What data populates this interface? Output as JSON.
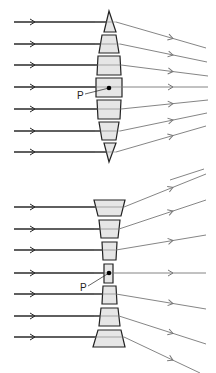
{
  "colors": {
    "background": "#ffffff",
    "incoming_ray": "#2a2a2a",
    "outgoing_ray": "#777777",
    "prism_fill": "#e6e6e6",
    "prism_stroke": "#222222",
    "point": "#000000"
  },
  "diagrams": [
    {
      "name": "converging-lens",
      "point_label": "P",
      "center_x": 109,
      "label_pos": {
        "x": 77,
        "y": 91
      },
      "point": {
        "x": 109,
        "y": 88
      },
      "rays": [
        {
          "y": 22,
          "exit_x": 116,
          "end": {
            "x": 206,
            "y": 48
          }
        },
        {
          "y": 44,
          "exit_x": 120,
          "end": {
            "x": 207,
            "y": 62
          }
        },
        {
          "y": 65,
          "exit_x": 121,
          "end": {
            "x": 208,
            "y": 76
          }
        },
        {
          "y": 87,
          "exit_x": 121,
          "end": {
            "x": 208,
            "y": 87
          }
        },
        {
          "y": 109,
          "exit_x": 121,
          "end": {
            "x": 208,
            "y": 100
          }
        },
        {
          "y": 131,
          "exit_x": 120,
          "end": {
            "x": 207,
            "y": 113
          }
        },
        {
          "y": 152,
          "exit_x": 116,
          "end": {
            "x": 206,
            "y": 126
          }
        }
      ],
      "prisms": [
        {
          "points": "109,11 104,32 116,32"
        },
        {
          "points": "102,35 116,35 119,53 99,53"
        },
        {
          "points": "98,56 120,56 121,75 97,75"
        },
        {
          "points": "96,78 122,78 122,97 96,97"
        },
        {
          "points": "97,100 121,100 120,119 98,119"
        },
        {
          "points": "99,122 119,122 116,140 102,140"
        },
        {
          "points": "104,143 116,143 109,162"
        }
      ],
      "extra_ray_fragment": {
        "x1": 170,
        "y1": 180,
        "x2": 204,
        "y2": 169
      }
    },
    {
      "name": "diverging-lens",
      "point_label": "P",
      "center_x": 108,
      "label_pos": {
        "x": 80,
        "y": 283
      },
      "point": {
        "x": 109,
        "y": 273
      },
      "rays": [
        {
          "y": 207,
          "exit_x": 124,
          "end": {
            "x": 206,
            "y": 174
          }
        },
        {
          "y": 229,
          "exit_x": 119,
          "end": {
            "x": 206,
            "y": 200
          }
        },
        {
          "y": 250,
          "exit_x": 116,
          "end": {
            "x": 206,
            "y": 235
          }
        },
        {
          "y": 273,
          "exit_x": 113,
          "end": {
            "x": 206,
            "y": 273
          }
        },
        {
          "y": 294,
          "exit_x": 116,
          "end": {
            "x": 206,
            "y": 309
          }
        },
        {
          "y": 316,
          "exit_x": 119,
          "end": {
            "x": 206,
            "y": 344
          }
        },
        {
          "y": 337,
          "exit_x": 124,
          "end": {
            "x": 200,
            "y": 373
          }
        }
      ],
      "prisms": [
        {
          "points": "94,200 125,200 121,216 98,216"
        },
        {
          "points": "99,220 120,220 118,238 101,238"
        },
        {
          "points": "102,242 117,242 116,260 103,260"
        },
        {
          "points": "104,264 113,264 113,283 104,283"
        },
        {
          "points": "103,286 116,286 117,304 102,304"
        },
        {
          "points": "101,308 118,308 120,326 99,326"
        },
        {
          "points": "98,330 121,330 125,347 93,347"
        }
      ]
    }
  ],
  "incoming_start_x": 14,
  "incoming_arrow_x": 34
}
